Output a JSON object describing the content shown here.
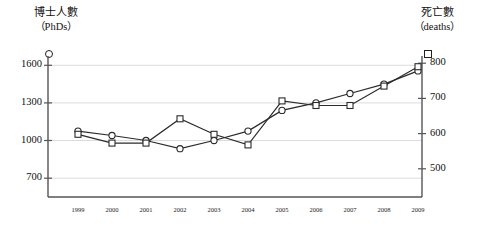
{
  "chart_data": {
    "type": "line",
    "title": "",
    "categories": [
      "1999",
      "2000",
      "2001",
      "2002",
      "2003",
      "2004",
      "2005",
      "2006",
      "2007",
      "2008",
      "2009"
    ],
    "x": [
      1999,
      2000,
      2001,
      2002,
      2003,
      2004,
      2005,
      2006,
      2007,
      2008,
      2009
    ],
    "series": [
      {
        "name": "博士人數（PhDs）",
        "axis": "left",
        "marker": "circle",
        "values": [
          1075,
          1040,
          1000,
          935,
          1000,
          1075,
          1240,
          1300,
          1375,
          1450,
          1555
        ]
      },
      {
        "name": "死亡數（deaths）",
        "axis": "right",
        "marker": "square",
        "values": [
          598,
          573,
          573,
          642,
          598,
          568,
          693,
          680,
          680,
          735,
          790
        ]
      }
    ],
    "left_axis": {
      "label_cn": "博士人數",
      "label_en": "（PhDs）",
      "ticks": [
        700,
        1000,
        1300,
        1600
      ],
      "tick_labels": [
        "700",
        "1000",
        "1300",
        "1600"
      ],
      "ylim": [
        550,
        1650
      ],
      "marker": "circle"
    },
    "right_axis": {
      "label_cn": "死亡數",
      "label_en": "（deaths）",
      "ticks": [
        500,
        600,
        700,
        800
      ],
      "tick_labels": [
        "500",
        "600",
        "700",
        "800"
      ],
      "ylim": [
        420,
        812
      ],
      "marker": "square"
    },
    "xlabel": "",
    "grid": true,
    "legend_position": "axis-top",
    "line_color": "#2b2b2b",
    "grid_color": "#dcdcdc",
    "axis_color": "#555555",
    "marker_fill": "#ffffff"
  }
}
